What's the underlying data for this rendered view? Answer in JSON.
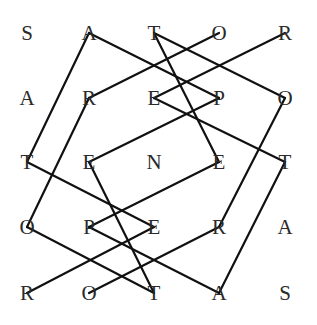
{
  "diagram": {
    "rows": [
      [
        "S",
        "A",
        "T",
        "O",
        "R"
      ],
      [
        "A",
        "R",
        "E",
        "P",
        "O"
      ],
      [
        "T",
        "E",
        "N",
        "E",
        "T"
      ],
      [
        "O",
        "P",
        "E",
        "R",
        "A"
      ],
      [
        "R",
        "O",
        "T",
        "A",
        "S"
      ]
    ],
    "column_x": [
      27,
      89,
      154,
      219,
      285
    ],
    "row_y": [
      33,
      98,
      162,
      227,
      293
    ],
    "line_color": "#111111",
    "text_color": "#2a2a2a",
    "connections": [
      {
        "from": [
          0,
          1
        ],
        "to": [
          2,
          0
        ]
      },
      {
        "from": [
          0,
          1
        ],
        "to": [
          1,
          3
        ]
      },
      {
        "from": [
          1,
          1
        ],
        "to": [
          0,
          3
        ]
      },
      {
        "from": [
          1,
          1
        ],
        "to": [
          3,
          0
        ]
      },
      {
        "from": [
          0,
          2
        ],
        "to": [
          1,
          4
        ]
      },
      {
        "from": [
          0,
          2
        ],
        "to": [
          2,
          3
        ]
      },
      {
        "from": [
          0,
          4
        ],
        "to": [
          1,
          2
        ]
      },
      {
        "from": [
          1,
          2
        ],
        "to": [
          2,
          4
        ]
      },
      {
        "from": [
          1,
          3
        ],
        "to": [
          2,
          1
        ]
      },
      {
        "from": [
          1,
          4
        ],
        "to": [
          3,
          3
        ]
      },
      {
        "from": [
          2,
          0
        ],
        "to": [
          3,
          2
        ]
      },
      {
        "from": [
          2,
          1
        ],
        "to": [
          4,
          2
        ]
      },
      {
        "from": [
          2,
          3
        ],
        "to": [
          3,
          1
        ]
      },
      {
        "from": [
          2,
          4
        ],
        "to": [
          4,
          3
        ]
      },
      {
        "from": [
          3,
          0
        ],
        "to": [
          4,
          2
        ]
      },
      {
        "from": [
          3,
          1
        ],
        "to": [
          4,
          3
        ]
      },
      {
        "from": [
          3,
          2
        ],
        "to": [
          4,
          0
        ]
      },
      {
        "from": [
          3,
          3
        ],
        "to": [
          4,
          1
        ]
      }
    ]
  }
}
